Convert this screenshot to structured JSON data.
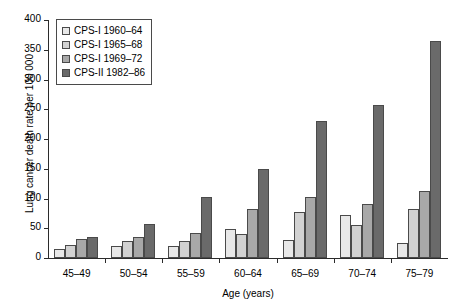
{
  "chart_data": {
    "type": "bar",
    "title": "",
    "xlabel": "Age (years)",
    "ylabel": "Lung cancer death rate per 100 000",
    "ylim": [
      0,
      400
    ],
    "yticks": [
      0,
      50,
      100,
      150,
      200,
      250,
      300,
      350,
      400
    ],
    "grid": false,
    "legend_position": "top-left",
    "categories": [
      "45–49",
      "50–54",
      "55–59",
      "60–64",
      "65–69",
      "70–74",
      "75–79"
    ],
    "series": [
      {
        "name": "CPS-I 1960–64",
        "color": "#e8e8e8",
        "values": [
          15,
          20,
          20,
          48,
          30,
          73,
          25
        ]
      },
      {
        "name": "CPS-I 1965–68",
        "color": "#d2d2d2",
        "values": [
          22,
          28,
          28,
          40,
          78,
          55,
          82
        ]
      },
      {
        "name": "CPS-I 1969–72",
        "color": "#a8a8a8",
        "values": [
          32,
          35,
          42,
          83,
          103,
          90,
          112
        ]
      },
      {
        "name": "CPS-II 1982–86",
        "color": "#6a6a6a",
        "values": [
          35,
          57,
          103,
          150,
          231,
          257,
          365
        ]
      }
    ]
  },
  "axes": {
    "y_title": "Lung cancer death rate per 100 000",
    "x_title": "Age (years)",
    "y_tick_labels": [
      "0",
      "50",
      "100",
      "150",
      "200",
      "250",
      "300",
      "350",
      "400"
    ],
    "x_tick_labels": [
      "45–49",
      "50–54",
      "55–59",
      "60–64",
      "65–69",
      "70–74",
      "75–79"
    ]
  },
  "legend": {
    "items": [
      {
        "label": "CPS-I 1960–64",
        "color": "#e8e8e8"
      },
      {
        "label": "CPS-I 1965–68",
        "color": "#d2d2d2"
      },
      {
        "label": "CPS-I 1969–72",
        "color": "#a8a8a8"
      },
      {
        "label": "CPS-II 1982–86",
        "color": "#6a6a6a"
      }
    ]
  },
  "colors": {
    "axis": "#2b2b2b",
    "bar_stroke": "#4a4a4a",
    "background": "#ffffff"
  }
}
